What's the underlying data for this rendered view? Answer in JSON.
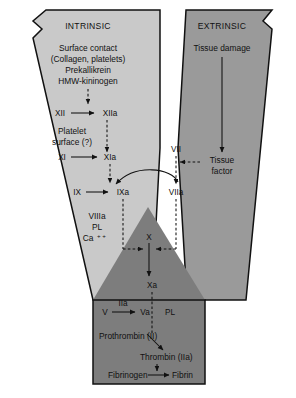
{
  "diagram": {
    "title_intrinsic": "INTRINSIC",
    "title_extrinsic": "EXTRINSIC",
    "colors": {
      "intrinsic_fill": "#c9c9c9",
      "extrinsic_fill": "#9a9a9a",
      "common_fill": "#7d7d7d",
      "outline": "#111111",
      "text": "#111111",
      "background": "#ffffff"
    }
  },
  "intrinsic": {
    "heading": "INTRINSIC",
    "initiators": [
      "Surface contact",
      "(Collagen, platelets)",
      "Prekallikrein",
      "HMW-kininogen"
    ],
    "factor_xii": "XII",
    "factor_xiia": "XIIa",
    "platelet_surface_line1": "Platelet",
    "platelet_surface_line2": "surface (?)",
    "factor_xi": "XI",
    "factor_xia": "XIa",
    "factor_ix": "IX",
    "factor_ixa": "IXa",
    "complex_line1": "VIIIa",
    "complex_line2": "PL",
    "complex_line3": "Ca",
    "complex_line3_sup": "+ +"
  },
  "extrinsic": {
    "heading": "EXTRINSIC",
    "tissue_damage": "Tissue damage",
    "tissue_factor_line1": "Tissue",
    "tissue_factor_line2": "factor",
    "factor_vii": "VII",
    "factor_viia": "VIIa"
  },
  "common": {
    "factor_x": "X",
    "factor_xa": "Xa",
    "factor_v": "V",
    "factor_iia_catalyst": "IIa",
    "factor_va": "Va",
    "pl": "PL",
    "prothrombin": "Prothrombin (II)",
    "thrombin": "Thrombin (IIa)",
    "fibrinogen": "Fibrinogen",
    "fibrin": "Fibrin"
  }
}
